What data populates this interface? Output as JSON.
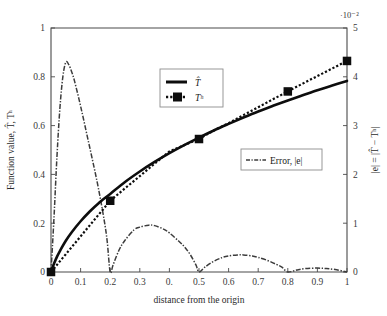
{
  "chart_data": {
    "type": "line",
    "title": "",
    "xlabel": "distance from the origin",
    "ylabel_left": "Function value, T̂, Tʰ",
    "ylabel_right": "|e| = |T̂ − Tʰ|",
    "right_axis_exponent": "·10⁻²",
    "xlim": [
      0,
      1
    ],
    "ylim_left": [
      0,
      1
    ],
    "ylim_right": [
      0,
      5
    ],
    "right_axis_scale": "1e-2",
    "grid": false,
    "xticks": [
      0,
      0.1,
      0.2,
      0.3,
      0.4,
      0.5,
      0.6,
      0.7,
      0.8,
      0.9,
      1
    ],
    "xticklabels": [
      "0",
      "0.1",
      "0.2",
      "0.3",
      "0.",
      "0.5",
      "0.6",
      "0.7",
      "0.8",
      "0.9",
      "1"
    ],
    "yticks_left": [
      0,
      0.2,
      0.4,
      0.6,
      0.8,
      1
    ],
    "yticklabels_left": [
      "0",
      "0.2",
      "0.4",
      "0.6",
      "0.8",
      "1"
    ],
    "yticks_right": [
      0,
      1,
      2,
      3,
      4,
      5
    ],
    "yticklabels_right": [
      "0",
      "1",
      "2",
      "3",
      "4",
      "5"
    ],
    "legend_position": [
      "upper-center-left",
      "center-right"
    ],
    "series": [
      {
        "name": "T̂",
        "label": "T̂",
        "axis": "left",
        "style": "solid",
        "color": "#0d0d0d",
        "x": [
          0.0,
          0.005,
          0.01,
          0.02,
          0.03,
          0.05,
          0.07,
          0.1,
          0.13,
          0.16,
          0.2,
          0.25,
          0.3,
          0.35,
          0.4,
          0.45,
          0.5,
          0.55,
          0.6,
          0.65,
          0.7,
          0.75,
          0.8,
          0.85,
          0.9,
          0.95,
          1.0
        ],
        "y": [
          0.0,
          0.018,
          0.034,
          0.062,
          0.086,
          0.128,
          0.163,
          0.208,
          0.247,
          0.281,
          0.32,
          0.369,
          0.412,
          0.451,
          0.487,
          0.52,
          0.551,
          0.58,
          0.607,
          0.633,
          0.658,
          0.681,
          0.703,
          0.724,
          0.745,
          0.764,
          0.783
        ]
      },
      {
        "name": "Tʰ",
        "label": "Tʰ",
        "axis": "left",
        "style": "dotted-with-square-markers",
        "color": "#0d0d0d",
        "marker": "square",
        "marker_x": [
          0.0,
          0.2,
          0.5,
          0.8,
          1.0
        ],
        "marker_y": [
          0.0,
          0.292,
          0.545,
          0.74,
          0.865
        ],
        "x": [
          0.0,
          0.05,
          0.1,
          0.15,
          0.2,
          0.25,
          0.3,
          0.35,
          0.4,
          0.45,
          0.5,
          0.55,
          0.6,
          0.65,
          0.7,
          0.75,
          0.8,
          0.85,
          0.9,
          0.95,
          1.0
        ],
        "y": [
          0.0,
          0.073,
          0.146,
          0.219,
          0.292,
          0.343,
          0.393,
          0.444,
          0.494,
          0.52,
          0.545,
          0.58,
          0.61,
          0.643,
          0.675,
          0.708,
          0.74,
          0.772,
          0.803,
          0.834,
          0.865
        ]
      },
      {
        "name": "Error, |e|",
        "label": "Error, |e|",
        "axis": "right",
        "style": "dash-dot",
        "color": "#3c3c3c",
        "x": [
          0.0,
          0.01,
          0.02,
          0.03,
          0.04,
          0.05,
          0.06,
          0.07,
          0.08,
          0.1,
          0.12,
          0.14,
          0.16,
          0.18,
          0.19,
          0.2,
          0.21,
          0.23,
          0.25,
          0.28,
          0.3,
          0.33,
          0.35,
          0.38,
          0.4,
          0.43,
          0.45,
          0.47,
          0.49,
          0.5,
          0.52,
          0.55,
          0.58,
          0.6,
          0.63,
          0.65,
          0.68,
          0.7,
          0.73,
          0.76,
          0.78,
          0.8,
          0.83,
          0.86,
          0.9,
          0.93,
          0.96,
          1.0
        ],
        "y": [
          0.0,
          1.1,
          2.35,
          3.35,
          4.0,
          4.3,
          4.25,
          4.1,
          3.9,
          3.4,
          2.85,
          2.3,
          1.72,
          1.05,
          0.62,
          0.0,
          0.15,
          0.45,
          0.65,
          0.86,
          0.92,
          0.96,
          0.95,
          0.88,
          0.8,
          0.64,
          0.52,
          0.36,
          0.14,
          0.0,
          0.1,
          0.22,
          0.3,
          0.33,
          0.35,
          0.35,
          0.33,
          0.3,
          0.24,
          0.16,
          0.1,
          0.0,
          0.04,
          0.07,
          0.08,
          0.07,
          0.05,
          0.0
        ]
      }
    ]
  },
  "legend_primary": {
    "entries": [
      {
        "label": "T̂",
        "style": "solid"
      },
      {
        "label": "Tʰ",
        "style": "dotted-square"
      }
    ]
  },
  "legend_secondary": {
    "entries": [
      {
        "label": "Error, |e|",
        "style": "dash-dot"
      }
    ]
  }
}
